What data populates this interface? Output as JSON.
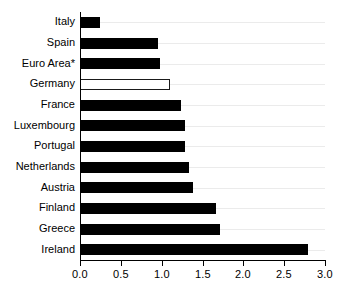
{
  "chart_data": {
    "type": "bar",
    "orientation": "horizontal",
    "title": "",
    "subtitle": "",
    "xlabel": "",
    "ylabel": "",
    "categories": [
      "Italy",
      "Spain",
      "Euro Area*",
      "Germany",
      "France",
      "Luxembourg",
      "Portugal",
      "Netherlands",
      "Austria",
      "Finland",
      "Greece",
      "Ireland"
    ],
    "values": [
      0.25,
      0.95,
      0.98,
      1.1,
      1.24,
      1.28,
      1.28,
      1.33,
      1.38,
      1.67,
      1.72,
      2.79
    ],
    "bar_styles": [
      "filled",
      "filled",
      "filled",
      "hollow",
      "filled",
      "filled",
      "filled",
      "filled",
      "filled",
      "filled",
      "filled",
      "filled"
    ],
    "xlim": [
      0.0,
      3.0
    ],
    "xticks": [
      0.0,
      0.5,
      1.0,
      1.5,
      2.0,
      2.5,
      3.0
    ],
    "xtick_labels": [
      "0.0",
      "0.5",
      "1.0",
      "1.5",
      "2.0",
      "2.5",
      "3.0"
    ],
    "grid": true,
    "grid_axis": "y",
    "legend": false,
    "legend_position": "none",
    "annotations": []
  },
  "colors": {
    "bar_fill": "#000000",
    "bar_outline": "#1a1a1a",
    "hollow_fill": "#ffffff",
    "axis": "#000000",
    "gridline": "#ebebeb",
    "background": "#ffffff",
    "text": "#000000"
  }
}
